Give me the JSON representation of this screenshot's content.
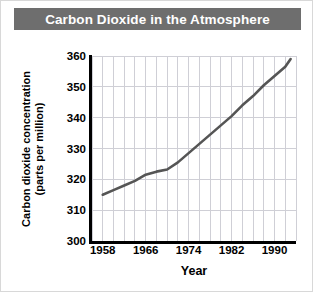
{
  "figure": {
    "title": "Carbon Dioxide in the Atmosphere",
    "background_color": "#ffffff",
    "title_bar_color": "#6e6e6e",
    "title_text_color": "#ffffff",
    "border_color": "#d8d8d8"
  },
  "chart_data": {
    "type": "line",
    "title": "Carbon Dioxide in the Atmosphere",
    "xlabel": "Year",
    "ylabel": "Carbon dioxide concentration (parts per million)",
    "ylabel_lines": [
      "Carbon dioxide concentration",
      "(parts per million)"
    ],
    "xlim": [
      1956,
      1994
    ],
    "ylim": [
      300,
      360
    ],
    "ytick_values": [
      300,
      310,
      320,
      330,
      340,
      350,
      360
    ],
    "ytick_labels": [
      "300",
      "310",
      "320",
      "330",
      "340",
      "350",
      "360"
    ],
    "xtick_values": [
      1958,
      1966,
      1974,
      1982,
      1990
    ],
    "xtick_labels": [
      "1958",
      "1966",
      "1974",
      "1982",
      "1990"
    ],
    "x_gridline_values": [
      1956,
      1958,
      1960,
      1962,
      1964,
      1966,
      1968,
      1970,
      1972,
      1974,
      1976,
      1978,
      1980,
      1982,
      1984,
      1986,
      1988,
      1990,
      1992,
      1994
    ],
    "y_gridline_values": [
      310,
      320,
      330,
      340,
      350,
      360
    ],
    "grid": true,
    "grid_color": "#cfcfd6",
    "legend": false,
    "line_color": "#555555",
    "line_width": 2.6,
    "x": [
      1958,
      1960,
      1962,
      1964,
      1966,
      1968,
      1970,
      1972,
      1974,
      1976,
      1978,
      1980,
      1982,
      1984,
      1986,
      1988,
      1990,
      1992,
      1993
    ],
    "values": [
      315.0,
      316.5,
      318.0,
      319.5,
      321.5,
      322.5,
      323.2,
      325.5,
      328.5,
      331.5,
      334.5,
      337.5,
      340.5,
      344.0,
      347.0,
      350.5,
      353.5,
      356.5,
      359.0
    ],
    "series": [
      {
        "name": "Carbon dioxide concentration",
        "color": "#555555",
        "values": [
          315.0,
          316.5,
          318.0,
          319.5,
          321.5,
          322.5,
          323.2,
          325.5,
          328.5,
          331.5,
          334.5,
          337.5,
          340.5,
          344.0,
          347.0,
          350.5,
          353.5,
          356.5,
          359.0
        ]
      }
    ]
  }
}
